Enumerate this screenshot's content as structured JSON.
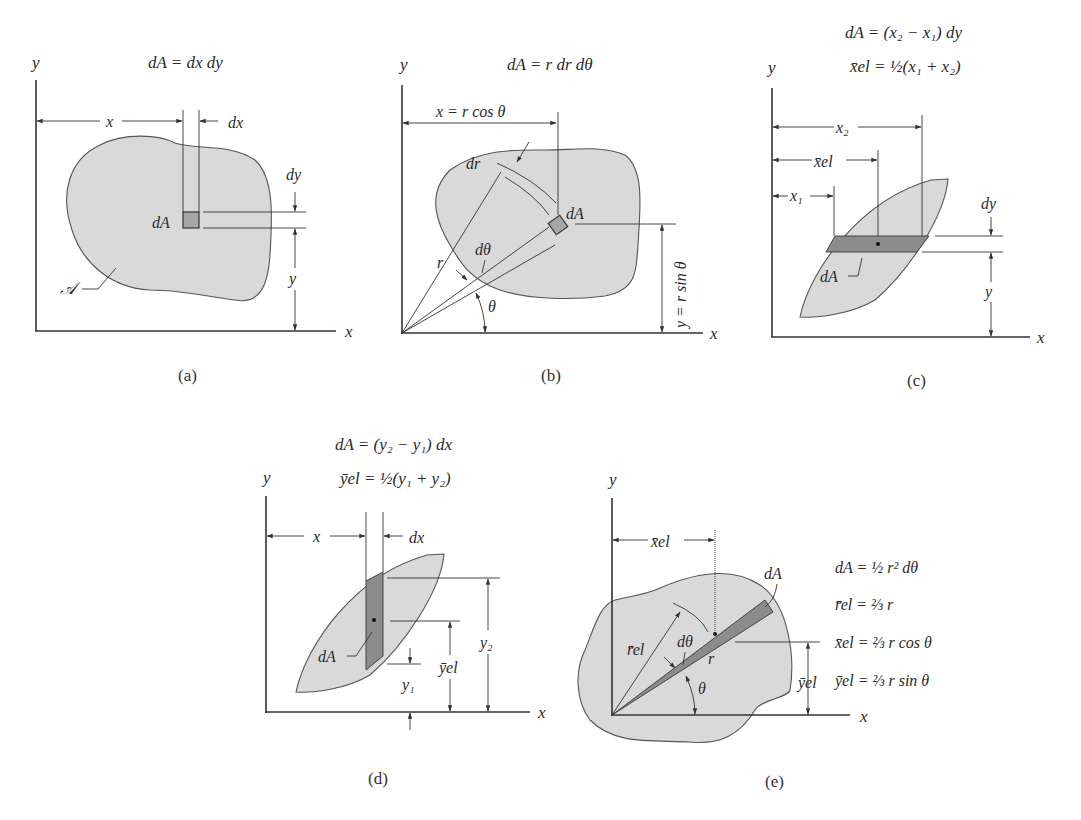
{
  "figure": {
    "panels": [
      {
        "id": "a",
        "caption": "(a)",
        "formula_lines": [
          "dA = dx dy"
        ],
        "labels": {
          "y_axis": "y",
          "x_axis": "x",
          "x_dim": "x",
          "dx": "dx",
          "dy": "dy",
          "y_dim": "y",
          "element": "dA",
          "region": "𝒜"
        }
      },
      {
        "id": "b",
        "caption": "(b)",
        "formula_lines": [
          "dA = r dr dθ"
        ],
        "labels": {
          "y_axis": "y",
          "x_axis": "x",
          "x_dim": "x = r cos θ",
          "y_dim": "y = r sin θ",
          "dr": "dr",
          "element": "dA",
          "r": "r",
          "dtheta": "dθ",
          "theta": "θ"
        }
      },
      {
        "id": "c",
        "caption": "(c)",
        "formula_lines": [
          "dA = (x₂ − x₁) dy",
          "x̄el = ½(x₁ + x₂)"
        ],
        "labels": {
          "y_axis": "y",
          "x_axis": "x",
          "x2": "x₂",
          "xel": "x̄el",
          "x1": "x₁",
          "dy": "dy",
          "y_dim": "y",
          "element": "dA"
        }
      },
      {
        "id": "d",
        "caption": "(d)",
        "formula_lines": [
          "dA = (y₂ − y₁) dx",
          "ȳel = ½(y₁ + y₂)"
        ],
        "labels": {
          "y_axis": "y",
          "x_axis": "x",
          "x_dim": "x",
          "dx": "dx",
          "y2": "y₂",
          "yel": "ȳel",
          "y1": "y₁",
          "element": "dA"
        }
      },
      {
        "id": "e",
        "caption": "(e)",
        "formula_lines": [
          "dA = ½ r² dθ",
          "r̄el = ⅔ r",
          "x̄el = ⅔ r cos θ",
          "ȳel = ⅔ r sin θ"
        ],
        "labels": {
          "y_axis": "y",
          "x_axis": "x",
          "xel": "x̄el",
          "rel": "r̄el",
          "yel": "ȳel",
          "element": "dA",
          "r": "r",
          "dtheta": "dθ",
          "theta": "θ"
        }
      }
    ]
  },
  "colors": {
    "region_fill": "#d9d9d9",
    "element_fill": "#8c8c8c",
    "outline": "#555555"
  }
}
